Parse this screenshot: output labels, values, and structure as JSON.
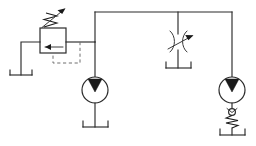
{
  "diagram": {
    "type": "hydraulic-schematic",
    "canvas": {
      "width": 256,
      "height": 146,
      "background": "#ffffff"
    },
    "stroke_color": "#2b2b2b",
    "pilot_color": "#6f6f6f",
    "fill_color": "#1a1a1a",
    "components": [
      {
        "id": "relief-valve",
        "label": "Adjustable pressure relief valve",
        "symbol": "relief-valve-icon",
        "x": 40,
        "y": 28,
        "width": 26,
        "height": 25,
        "features": [
          "adjustable-spring-arrow",
          "internal-flow-arrow-left",
          "dashed-pilot-line"
        ]
      },
      {
        "id": "tank-left",
        "label": "Reservoir (tank) — relief valve return",
        "symbol": "tank-icon",
        "x": 21,
        "y": 75
      },
      {
        "id": "pump-left",
        "label": "Hydraulic pump / motor",
        "symbol": "pump-icon",
        "cx": 95,
        "cy": 90,
        "r": 13,
        "features": [
          "filled-triangle-up"
        ]
      },
      {
        "id": "tank-pump-left",
        "label": "Reservoir (tank) — left pump suction",
        "symbol": "tank-icon",
        "x": 95,
        "y": 127
      },
      {
        "id": "flow-control-valve",
        "label": "Adjustable throttle / flow control valve",
        "symbol": "throttle-valve-icon",
        "cx": 178,
        "cy": 42,
        "features": [
          "adjustable-arrow",
          "orifice-restriction"
        ]
      },
      {
        "id": "tank-flow-control",
        "label": "Reservoir (tank) — flow control return",
        "symbol": "tank-icon",
        "x": 178,
        "y": 68
      },
      {
        "id": "pump-right",
        "label": "Hydraulic pump / motor",
        "symbol": "pump-icon",
        "cx": 232,
        "cy": 90,
        "r": 13,
        "features": [
          "filled-triangle-up"
        ]
      },
      {
        "id": "check-valve-spring",
        "label": "Spring-loaded check valve",
        "symbol": "check-valve-icon",
        "cx": 232,
        "cy": 113,
        "features": [
          "ball-poppet",
          "return-spring"
        ]
      },
      {
        "id": "tank-right",
        "label": "Reservoir (tank) — right pump suction",
        "symbol": "tank-icon",
        "x": 232,
        "y": 135
      }
    ],
    "connections": [
      {
        "id": "main-pressure-line",
        "label": "Main pressure line (top manifold)",
        "from": "junction-left",
        "to": "junction-right"
      },
      {
        "id": "relief-inlet-line",
        "label": "Relief valve inlet line",
        "from": "relief-valve",
        "to": "main-pressure-line"
      },
      {
        "id": "relief-tank-line",
        "label": "Relief valve tank drain line",
        "from": "relief-valve",
        "to": "tank-left"
      },
      {
        "id": "pilot-line",
        "label": "Pilot sensing line (dashed)",
        "from": "main-pressure-line",
        "to": "relief-valve",
        "style": "dashed"
      },
      {
        "id": "pump-left-line",
        "label": "Left pump delivery line",
        "from": "pump-left",
        "to": "main-pressure-line"
      },
      {
        "id": "flow-control-line",
        "label": "Flow control branch line",
        "from": "main-pressure-line",
        "to": "flow-control-valve"
      },
      {
        "id": "pump-right-line",
        "label": "Right pump delivery line",
        "from": "pump-right",
        "to": "main-pressure-line"
      }
    ]
  }
}
